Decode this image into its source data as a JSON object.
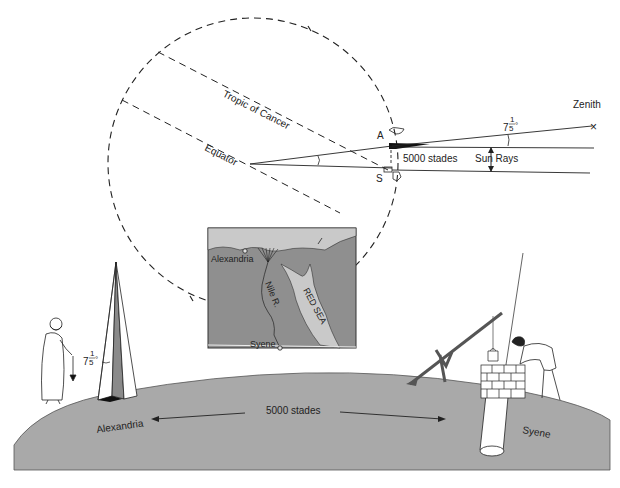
{
  "diagram": {
    "type": "illustration",
    "colors": {
      "background": "#ffffff",
      "ground": "#a9a9a9",
      "map_land": "#8f8f8f",
      "map_sea": "#c9c9c9",
      "line": "#222222"
    },
    "earth_cross_section": {
      "tropic_label": "Tropic of Cancer",
      "equator_label": "Equator",
      "point_a_label": "A",
      "point_s_label": "S",
      "arc_distance_label": "5000 stades",
      "sun_rays_label": "Sun Rays",
      "angle_label_whole": "7",
      "angle_label_num": "1",
      "angle_label_den": "5",
      "angle_label_deg": "°",
      "zenith_label": "Zenith",
      "zenith_marker": "×"
    },
    "map_inset": {
      "alexandria_label": "Alexandria",
      "nile_label": "Nile R.",
      "red_sea_label": "RED SEA",
      "syene_label": "Syene"
    },
    "ground_scene": {
      "obelisk_angle_whole": "7",
      "obelisk_angle_num": "1",
      "obelisk_angle_den": "5",
      "obelisk_angle_deg": "°",
      "distance_label": "5000 stades",
      "left_city_label": "Alexandria",
      "right_city_label": "Syene"
    }
  }
}
